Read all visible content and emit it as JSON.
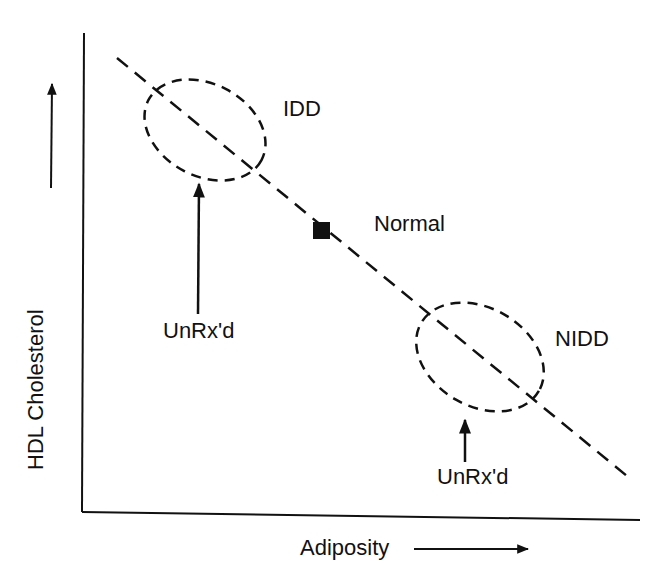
{
  "diagram": {
    "axes": {
      "x_label": "Adiposity",
      "y_label": "HDL Cholesterol"
    },
    "regions": [
      {
        "id": "idd",
        "label": "IDD",
        "annotation": "UnRx'd"
      },
      {
        "id": "nidd",
        "label": "NIDD",
        "annotation": "UnRx'd"
      }
    ],
    "points": [
      {
        "id": "normal",
        "label": "Normal",
        "marker": "filled-square"
      }
    ],
    "trend_line": {
      "style": "dashed",
      "direction": "negative"
    },
    "colors": {
      "ink": "#111111",
      "background": "#ffffff"
    }
  }
}
